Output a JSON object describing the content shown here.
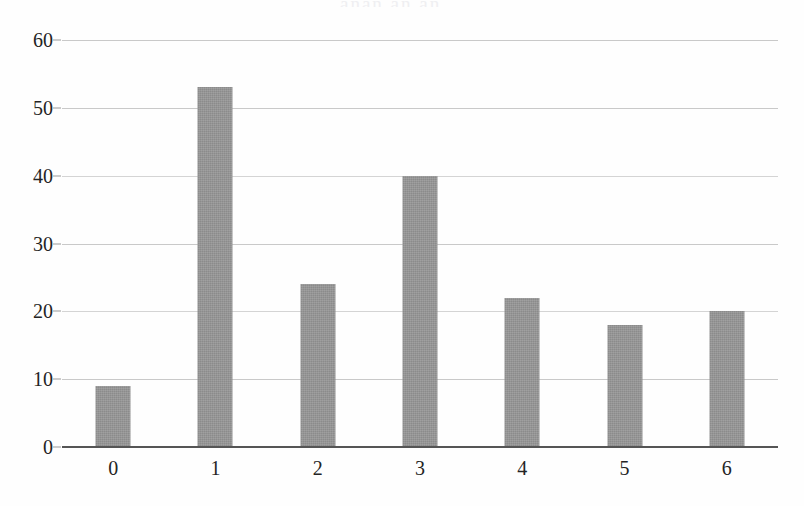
{
  "chart_data": {
    "type": "bar",
    "title": "",
    "subtitle": "",
    "xlabel": "",
    "ylabel": "",
    "categories": [
      "0",
      "1",
      "2",
      "3",
      "4",
      "5",
      "6"
    ],
    "values": [
      9,
      53,
      24,
      40,
      22,
      18,
      20
    ],
    "series": [
      {
        "name": "",
        "values": [
          9,
          53,
          24,
          40,
          22,
          18,
          20
        ]
      }
    ],
    "ylim": [
      0,
      60
    ],
    "xlim_categories": 7,
    "yticks": [
      0,
      10,
      20,
      30,
      40,
      50,
      60
    ],
    "ytick_labels": [
      "0",
      "10",
      "20",
      "30",
      "40",
      "50",
      "60"
    ],
    "xtick_labels": [
      "0",
      "1",
      "2",
      "3",
      "4",
      "5",
      "6"
    ],
    "grid": true,
    "grid_axis": "y",
    "legend": false,
    "legend_position": "none",
    "annotations": [],
    "bar_color": "#8b8b8b",
    "grid_color": "#c9c9c9",
    "axis_color": "#555555",
    "text_color": "#242424",
    "background_color": "#fefefe"
  },
  "figure": {
    "title_remnant": "anan an an"
  }
}
